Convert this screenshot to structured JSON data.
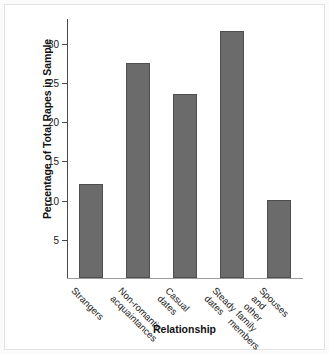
{
  "chart_data": {
    "type": "bar",
    "title": "",
    "xlabel": "Relationship",
    "ylabel": "Percentage of Total Rapes in Sample",
    "categories": [
      "Strangers",
      "Non-romantic\nacquaintances",
      "Casual\ndates",
      "Steady\ndates",
      "Spouses\nand other\nfamily\nmembers"
    ],
    "values": [
      12.0,
      27.4,
      23.5,
      31.5,
      10.0
    ],
    "ylim": [
      0,
      33
    ],
    "yticks": [
      5,
      10,
      15,
      20,
      25,
      30
    ],
    "ytick_labels": [
      "5",
      "10",
      "15",
      "20",
      "25",
      "30"
    ],
    "grid": false,
    "legend": "none",
    "bar_color": "#6b6b6b",
    "bar_border_color": "#4e4e4e",
    "axis_color": "#4a4a4a",
    "background": "#ffffff"
  }
}
